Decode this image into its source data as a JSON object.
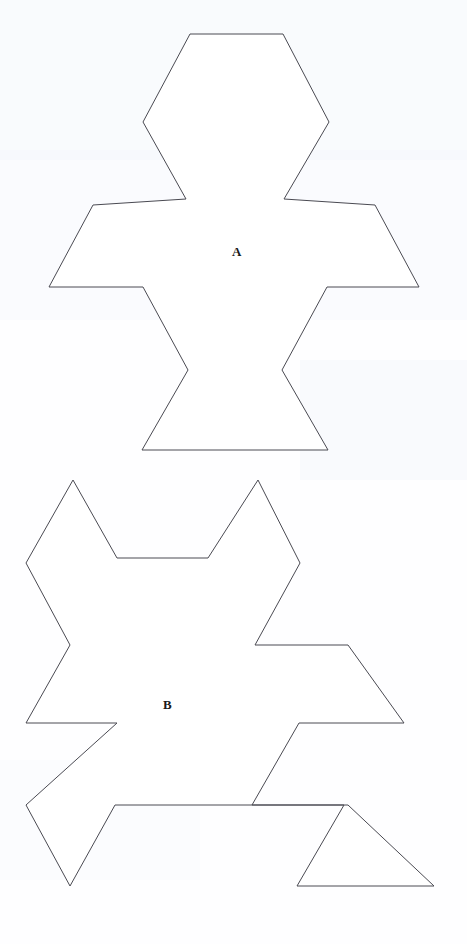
{
  "page": {
    "background_color": "#ffffff",
    "ink_color": "#4a4a52",
    "width": 467,
    "height": 944,
    "description": "Two outline tessellation tiles labelled A and B on a white scanned page"
  },
  "figures": [
    {
      "id": "tile-a",
      "label": "A",
      "label_position": {
        "x": 236,
        "y": 253
      },
      "stroke": "#4a4a52",
      "fill": "#ffffff",
      "points": "190,34 283,34 329,122 283,194 293,199 292,199 349,199 375,206 419,286 327,286 315,292 315,292 311,343 303,345 305,371 328,450 142,450 165,371 167,345 159,343 155,292 143,286 49,286 94,206 120,199 177,199 186,194 143,122"
    },
    {
      "id": "tile-b",
      "label": "B",
      "label_position": {
        "x": 167,
        "y": 706
      },
      "stroke": "#4a4a52",
      "fill": "#ffffff",
      "points": "73,480 116,558 28,560 28,560 73,648 70,650 72,650 118,737 215,737 215,737 250,689 254,690 256,690 348,690 403,628 404,628 349,563 258,480 298,561 298,561 300,563 208,563 115,563 115,563 70,650 72,650 28,560"
    }
  ],
  "tile_a_geometry": {
    "comment": "Vertex list, clockwise from the top-left of the head, in page pixel coordinates",
    "vertices": [
      {
        "x": 190,
        "y": 34
      },
      {
        "x": 283,
        "y": 34
      },
      {
        "x": 329,
        "y": 122
      },
      {
        "x": 284,
        "y": 199
      },
      {
        "x": 375,
        "y": 205
      },
      {
        "x": 419,
        "y": 287
      },
      {
        "x": 327,
        "y": 287
      },
      {
        "x": 282,
        "y": 370
      },
      {
        "x": 328,
        "y": 450
      },
      {
        "x": 142,
        "y": 450
      },
      {
        "x": 188,
        "y": 370
      },
      {
        "x": 143,
        "y": 287
      },
      {
        "x": 49,
        "y": 287
      },
      {
        "x": 93,
        "y": 205
      },
      {
        "x": 186,
        "y": 199
      },
      {
        "x": 143,
        "y": 122
      }
    ]
  },
  "tile_b_geometry": {
    "comment": "Vertex list for tile B, the same tile rotated; page pixel coordinates",
    "vertices": [
      {
        "x": 73,
        "y": 480
      },
      {
        "x": 117,
        "y": 558
      },
      {
        "x": 208,
        "y": 558
      },
      {
        "x": 258,
        "y": 480
      },
      {
        "x": 300,
        "y": 563
      },
      {
        "x": 255,
        "y": 645
      },
      {
        "x": 348,
        "y": 645
      },
      {
        "x": 404,
        "y": 723
      },
      {
        "x": 299,
        "y": 723
      },
      {
        "x": 252,
        "y": 805
      },
      {
        "x": 344,
        "y": 805
      },
      {
        "x": 297,
        "y": 886
      },
      {
        "x": 434,
        "y": 886
      },
      {
        "x": 348,
        "y": 805
      },
      {
        "x": 115,
        "y": 805
      },
      {
        "x": 70,
        "y": 886
      },
      {
        "x": 26,
        "y": 805
      },
      {
        "x": 117,
        "y": 723
      },
      {
        "x": 26,
        "y": 723
      },
      {
        "x": 70,
        "y": 645
      },
      {
        "x": 26,
        "y": 563
      }
    ]
  },
  "a11y": {
    "figure_a_title": "Tile A outline",
    "figure_b_title": "Tile B outline"
  }
}
